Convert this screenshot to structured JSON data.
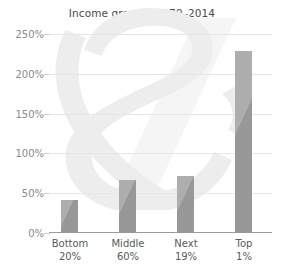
{
  "chart_data": {
    "type": "bar",
    "title": "Income growth, 1979–2014",
    "xlabel": "",
    "ylabel": "",
    "categories": [
      "Bottom 20%",
      "Middle 60%",
      "Next 19%",
      "Top 1%"
    ],
    "category_lines": [
      {
        "line1": "Bottom",
        "line2": "20%"
      },
      {
        "line1": "Middle",
        "line2": "60%"
      },
      {
        "line1": "Next",
        "line2": "19%"
      },
      {
        "line1": "Top",
        "line2": "1%"
      }
    ],
    "values": [
      41,
      67,
      72,
      229
    ],
    "value_labels": [
      "41%",
      "67%",
      "72%",
      "229%"
    ],
    "ylim": [
      0,
      250
    ],
    "yticks": [
      0,
      50,
      100,
      150,
      200,
      250
    ],
    "ytick_labels": [
      "0%",
      "50%",
      "100%",
      "150%",
      "200%",
      "250%"
    ],
    "grid": true,
    "legend": "none",
    "colors": {
      "bar": "#9e9e9e",
      "gridline": "#e6e6e6",
      "axis": "#9b9b9b",
      "title_text": "#4a4a4a",
      "tick_text": "#8a8a8a",
      "category_text": "#5a5a5a",
      "watermark": "#ededed",
      "background": "#ffffff"
    },
    "watermark": {
      "name": "ampersand-watermark",
      "glyph": "&"
    }
  }
}
